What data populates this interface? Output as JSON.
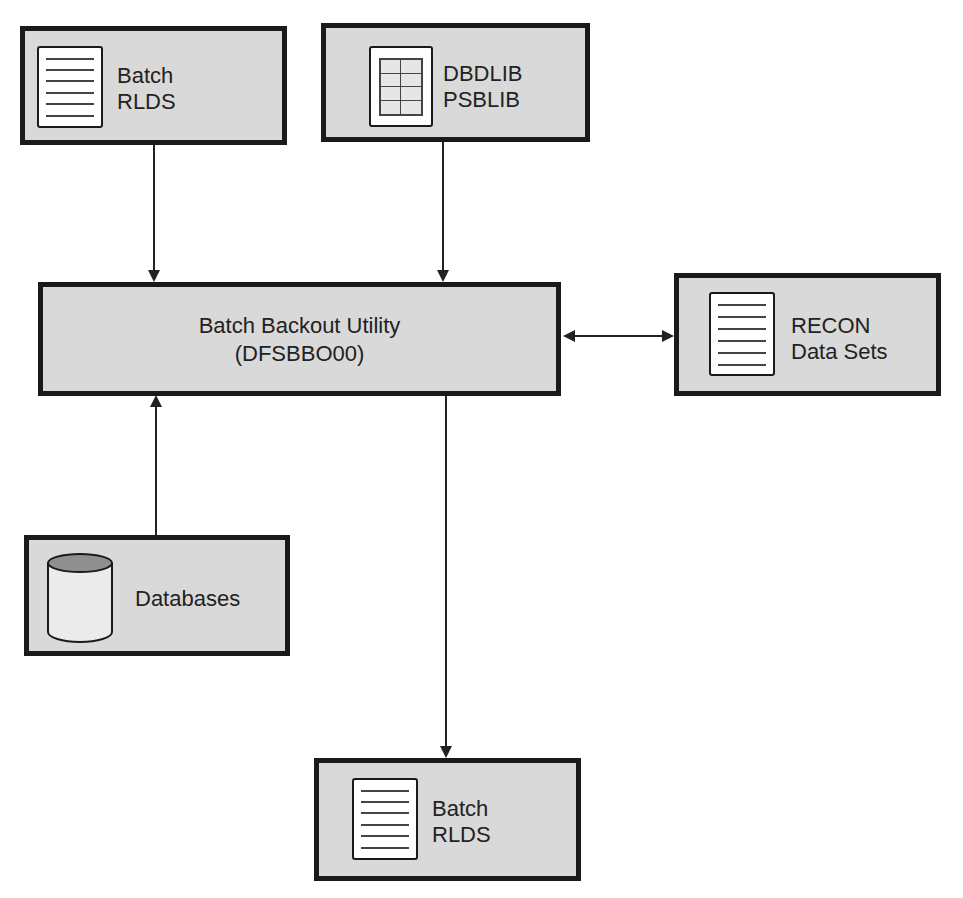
{
  "diagram": {
    "nodes": {
      "batch_rlds_input": {
        "line1": "Batch",
        "line2": "RLDS",
        "icon": "document-icon"
      },
      "dbdlib_psblib": {
        "line1": "DBDLIB",
        "line2": "PSBLIB",
        "icon": "library-grid-icon"
      },
      "batch_backout_utility": {
        "line1": "Batch Backout Utility",
        "line2": "(DFSBBO00)"
      },
      "recon_data_sets": {
        "line1": "RECON",
        "line2": "Data Sets",
        "icon": "document-icon"
      },
      "databases": {
        "line1": "Databases",
        "icon": "database-cylinder-icon"
      },
      "batch_rlds_output": {
        "line1": "Batch",
        "line2": "RLDS",
        "icon": "document-icon"
      }
    },
    "edges": [
      {
        "from": "Batch RLDS (input)",
        "to": "Batch Backout Utility",
        "direction": "one-way"
      },
      {
        "from": "DBDLIB PSBLIB",
        "to": "Batch Backout Utility",
        "direction": "one-way"
      },
      {
        "from": "Databases",
        "to": "Batch Backout Utility",
        "direction": "one-way"
      },
      {
        "from": "Batch Backout Utility",
        "to": "RECON Data Sets",
        "direction": "two-way"
      },
      {
        "from": "Batch Backout Utility",
        "to": "Batch RLDS (output)",
        "direction": "one-way"
      }
    ],
    "colors": {
      "box_fill": "#d9d9d9",
      "box_border": "#1a1a1a",
      "arrow": "#222222",
      "icon_fill": "#ffffff",
      "cylinder_top": "#8f8f8f"
    }
  }
}
